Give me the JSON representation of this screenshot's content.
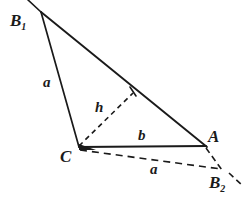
{
  "figure": {
    "background_color": "#ffffff",
    "stroke_color": "#1a1a1a",
    "vertices": {
      "B1": {
        "label": "B",
        "subscript": "1",
        "x": 41,
        "y": 12
      },
      "C": {
        "label": "C",
        "subscript": "",
        "x": 79,
        "y": 147
      },
      "A": {
        "label": "A",
        "subscript": "",
        "x": 206,
        "y": 146
      },
      "B2": {
        "label": "B",
        "subscript": "2",
        "x": 222,
        "y": 169
      },
      "H": {
        "label": "",
        "subscript": "",
        "x": 133,
        "y": 93
      }
    },
    "labels": {
      "B1": {
        "text": "B",
        "sub": "1",
        "x": 10,
        "y": 12
      },
      "C": {
        "text": "C",
        "sub": "",
        "x": 60,
        "y": 150
      },
      "A": {
        "text": "A",
        "sub": "",
        "x": 208,
        "y": 130
      },
      "B2": {
        "text": "B",
        "sub": "2",
        "x": 209,
        "y": 175
      },
      "side_a_upper": {
        "text": "a",
        "sub": "",
        "x": 43,
        "y": 75
      },
      "side_h": {
        "text": "h",
        "sub": "",
        "x": 95,
        "y": 100
      },
      "side_b": {
        "text": "b",
        "sub": "",
        "x": 138,
        "y": 128
      },
      "side_a_lower": {
        "text": "a",
        "sub": "",
        "x": 150,
        "y": 162
      }
    },
    "segments": [
      {
        "name": "ray-above-B1",
        "style": "solid",
        "from": [
          28,
          0
        ],
        "to": [
          41,
          12
        ]
      },
      {
        "name": "segment-B1-C",
        "style": "solid",
        "from": [
          41,
          12
        ],
        "to": [
          79,
          147
        ]
      },
      {
        "name": "segment-B1-A",
        "style": "solid",
        "from": [
          41,
          12
        ],
        "to": [
          206,
          146
        ]
      },
      {
        "name": "segment-C-A",
        "style": "solid",
        "from": [
          79,
          147
        ],
        "to": [
          206,
          146
        ]
      },
      {
        "name": "altitude-C-H",
        "style": "dashed",
        "from": [
          79,
          146
        ],
        "to": [
          133,
          93
        ]
      },
      {
        "name": "segment-C-B2",
        "style": "dashed",
        "from": [
          80,
          150
        ],
        "to": [
          222,
          169
        ]
      },
      {
        "name": "segment-A-B2",
        "style": "dashed",
        "from": [
          206,
          148
        ],
        "to": [
          222,
          169
        ]
      },
      {
        "name": "ray-beyond-B2",
        "style": "dashed",
        "from": [
          228,
          172
        ],
        "to": [
          243,
          186
        ]
      }
    ]
  }
}
